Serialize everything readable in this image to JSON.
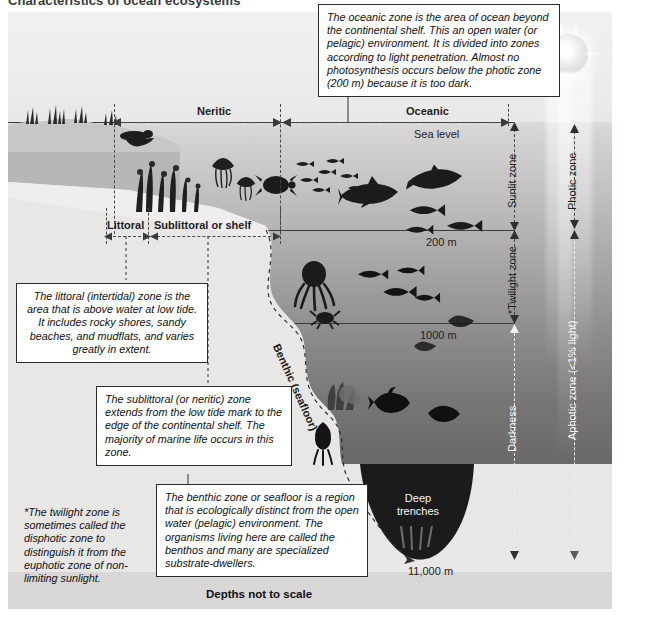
{
  "title": "Characteristics of ocean ecosystems",
  "zones": {
    "neritic": "Neritic",
    "oceanic": "Oceanic",
    "littoral": "Littoral",
    "sublittoral": "Sublittoral or shelf",
    "benthic": "Benthic (seafloor)",
    "deep_trenches": "Deep\ntrenches"
  },
  "depth_markers": {
    "sea_level": "Sea level",
    "m200": "200 m",
    "m1000": "1000 m",
    "m6000": "6000 m",
    "m11000": "11,000 m"
  },
  "light_zones": {
    "sunlit": "Sunlit zone",
    "twilight": "*Twilight zone",
    "darkness": "Darkness",
    "photic": "Photic zone",
    "aphotic": "Aphotic zone (<1% light)"
  },
  "callouts": {
    "oceanic": "The oceanic zone is the area of ocean beyond the continental shelf. This an open water (or pelagic) environment. It is divided into zones according to light penetration. Almost no photosynthesis occurs below the photic zone (200 m) because it is too dark.",
    "littoral": "The littoral (intertidal) zone is the area that is above water at low tide. It includes rocky shores, sandy beaches, and mudflats, and varies greatly in extent.",
    "sublittoral": "The sublittoral (or neritic) zone extends from the low tide mark to the edge of the continental shelf. The majority of marine life occurs in this zone.",
    "benthic": "The benthic zone or seafloor is a region that is ecologically distinct from the open water (pelagic) environment. The organisms living here are called the benthos and many are specialized substrate-dwellers.",
    "twilight_note": "*The twilight zone is sometimes called the disphotic zone to distinguish it from the euphotic zone of  non-limiting sunlight."
  },
  "footer": {
    "scale_note": "Depths not to scale"
  },
  "colors": {
    "surface_water": "#eceaea",
    "deep_water": "#5c5a5a",
    "seafloor": "#e8e7e6",
    "trench": "#1a1a1a",
    "line": "#3b3b3b",
    "callout_bg": "#ffffff",
    "callout_border": "#2b2b2b"
  }
}
